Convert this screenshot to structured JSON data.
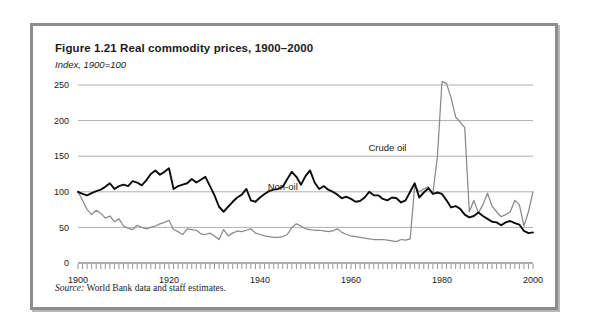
{
  "figure": {
    "title": "Figure 1.21  Real commodity prices, 1900–2000",
    "subtitle": "Index, 1900=100",
    "source": "World Bank data and staff estimates.",
    "source_lead": "Source:"
  },
  "chart_data": {
    "type": "line",
    "title": "Figure 1.21  Real commodity prices, 1900–2000",
    "subtitle": "Index, 1900=100",
    "xlabel": "",
    "ylabel": "Index, 1900=100",
    "xlim": [
      1900,
      2000
    ],
    "ylim": [
      0,
      260
    ],
    "yticks": [
      0,
      50,
      100,
      150,
      200,
      250
    ],
    "xticks": [
      1900,
      1920,
      1940,
      1960,
      1980,
      2000
    ],
    "xtick_labels": [
      "1900",
      "1920",
      "1940",
      "1960",
      "1980",
      "2000"
    ],
    "ytick_labels": [
      "0",
      "50",
      "100",
      "150",
      "200",
      "250"
    ],
    "grid": true,
    "minor_xticks_every": 1,
    "legend": "inline-annotations",
    "annotations": [
      {
        "text": "Crude oil",
        "x": 1968,
        "y": 158
      },
      {
        "text": "Non-oil",
        "x": 1945,
        "y": 103
      }
    ],
    "colors": {
      "crude_oil": "#8a8a8a",
      "non_oil": "#0d0d0d",
      "grid": "#9a9a9a",
      "frame": "#8d8d8d"
    },
    "x": [
      1900,
      1901,
      1902,
      1903,
      1904,
      1905,
      1906,
      1907,
      1908,
      1909,
      1910,
      1911,
      1912,
      1913,
      1914,
      1915,
      1916,
      1917,
      1918,
      1919,
      1920,
      1921,
      1922,
      1923,
      1924,
      1925,
      1926,
      1927,
      1928,
      1929,
      1930,
      1931,
      1932,
      1933,
      1934,
      1935,
      1936,
      1937,
      1938,
      1939,
      1940,
      1941,
      1942,
      1943,
      1944,
      1945,
      1946,
      1947,
      1948,
      1949,
      1950,
      1951,
      1952,
      1953,
      1954,
      1955,
      1956,
      1957,
      1958,
      1959,
      1960,
      1961,
      1962,
      1963,
      1964,
      1965,
      1966,
      1967,
      1968,
      1969,
      1970,
      1971,
      1972,
      1973,
      1974,
      1975,
      1976,
      1977,
      1978,
      1979,
      1980,
      1981,
      1982,
      1983,
      1984,
      1985,
      1986,
      1987,
      1988,
      1989,
      1990,
      1991,
      1992,
      1993,
      1994,
      1995,
      1996,
      1997,
      1998,
      1999,
      2000
    ],
    "series": [
      {
        "name": "Non-oil",
        "color": "#0d0d0d",
        "values": [
          100,
          97,
          95,
          98,
          101,
          103,
          107,
          112,
          104,
          108,
          110,
          108,
          115,
          113,
          109,
          116,
          125,
          130,
          124,
          128,
          133,
          104,
          108,
          110,
          112,
          118,
          113,
          117,
          121,
          108,
          95,
          79,
          72,
          79,
          86,
          92,
          96,
          104,
          88,
          86,
          92,
          97,
          101,
          103,
          104,
          107,
          118,
          128,
          121,
          110,
          122,
          130,
          113,
          104,
          108,
          103,
          100,
          96,
          91,
          93,
          90,
          86,
          87,
          92,
          100,
          95,
          95,
          90,
          88,
          92,
          91,
          85,
          88,
          100,
          112,
          92,
          99,
          105,
          97,
          99,
          97,
          88,
          78,
          80,
          76,
          68,
          64,
          66,
          71,
          66,
          62,
          58,
          57,
          53,
          57,
          59,
          56,
          54,
          45,
          42,
          43
        ]
      },
      {
        "name": "Crude oil",
        "color": "#8a8a8a",
        "values": [
          100,
          88,
          75,
          68,
          74,
          70,
          63,
          66,
          58,
          62,
          52,
          49,
          47,
          53,
          50,
          48,
          50,
          52,
          55,
          57,
          60,
          47,
          44,
          40,
          48,
          47,
          46,
          41,
          40,
          42,
          38,
          33,
          47,
          38,
          42,
          45,
          44,
          46,
          48,
          42,
          40,
          38,
          37,
          36,
          36,
          37,
          40,
          50,
          55,
          52,
          48,
          47,
          46,
          46,
          45,
          44,
          45,
          48,
          43,
          40,
          38,
          37,
          36,
          35,
          34,
          33,
          33,
          33,
          32,
          31,
          30,
          33,
          32,
          34,
          108,
          100,
          104,
          107,
          98,
          150,
          255,
          252,
          232,
          205,
          198,
          190,
          72,
          88,
          70,
          82,
          98,
          80,
          72,
          65,
          68,
          72,
          88,
          82,
          52,
          72,
          100
        ]
      }
    ]
  },
  "axes": {
    "y_labels": [
      "250",
      "200",
      "150",
      "100",
      "50",
      "0"
    ],
    "x_labels": [
      "1900",
      "1920",
      "1940",
      "1960",
      "1980",
      "2000"
    ]
  },
  "labels": {
    "crude_oil": "Crude oil",
    "non_oil": "Non-oil"
  }
}
